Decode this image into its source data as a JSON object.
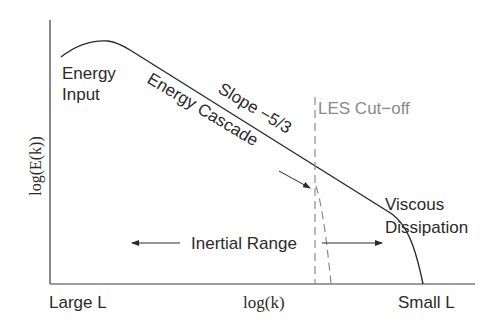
{
  "diagram": {
    "type": "energy-spectrum-schematic",
    "axes": {
      "ylabel": "log(E(k))",
      "xlabel": "log(k)",
      "x_left_label": "Large L",
      "x_right_label": "Small L"
    },
    "annotations": {
      "energy_input_line1": "Energy",
      "energy_input_line2": "Input",
      "energy_cascade": "Energy Cascade",
      "slope": "Slope −5/3",
      "les_cutoff": "LES Cut−off",
      "viscous_line1": "Viscous",
      "viscous_line2": "Dissipation",
      "inertial_range": "Inertial Range"
    },
    "colors": {
      "curve": "#2a2a2a",
      "axis": "#3a3a3a",
      "cutoff": "#8a8a8a",
      "background": "#ffffff"
    }
  }
}
